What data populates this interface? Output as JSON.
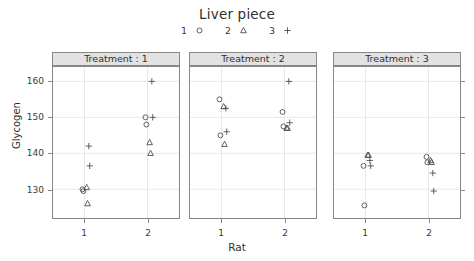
{
  "chart_data": {
    "type": "scatter",
    "title": "Liver piece",
    "xlabel": "Rat",
    "ylabel": "Glycogen",
    "grid": true,
    "legend_position": "top",
    "legend_title": "Liver piece",
    "x_categories": [
      "1",
      "2"
    ],
    "xlim": [
      0.5,
      2.5
    ],
    "ylim": [
      122,
      164
    ],
    "yticks": [
      130,
      140,
      150,
      160
    ],
    "ytick_labels": [
      "130",
      "140",
      "150",
      "160"
    ],
    "panel_variable": "Treatment",
    "panels": [
      {
        "label": "Treatment : 1",
        "series": [
          {
            "name": "1",
            "symbol": "circle",
            "points": [
              {
                "x": 1,
                "y": 130.0
              },
              {
                "x": 1,
                "y": 129.5
              },
              {
                "x": 2,
                "y": 150.0
              },
              {
                "x": 2,
                "y": 148.0
              }
            ]
          },
          {
            "name": "2",
            "symbol": "triangle",
            "points": [
              {
                "x": 1,
                "y": 130.5
              },
              {
                "x": 1,
                "y": 126.0
              },
              {
                "x": 2,
                "y": 143.0
              },
              {
                "x": 2,
                "y": 140.0
              }
            ]
          },
          {
            "name": "3",
            "symbol": "plus",
            "points": [
              {
                "x": 1,
                "y": 142.0
              },
              {
                "x": 1,
                "y": 136.5
              },
              {
                "x": 2,
                "y": 160.0
              },
              {
                "x": 2,
                "y": 150.0
              }
            ]
          }
        ]
      },
      {
        "label": "Treatment : 2",
        "series": [
          {
            "name": "1",
            "symbol": "circle",
            "points": [
              {
                "x": 1,
                "y": 155.0
              },
              {
                "x": 1,
                "y": 145.0
              },
              {
                "x": 2,
                "y": 151.5
              },
              {
                "x": 2,
                "y": 147.5
              }
            ]
          },
          {
            "name": "2",
            "symbol": "triangle",
            "points": [
              {
                "x": 1,
                "y": 153.0
              },
              {
                "x": 1,
                "y": 142.5
              },
              {
                "x": 2,
                "y": 147.0
              },
              {
                "x": 2,
                "y": 147.0
              }
            ]
          },
          {
            "name": "3",
            "symbol": "plus",
            "points": [
              {
                "x": 1,
                "y": 152.5
              },
              {
                "x": 1,
                "y": 146.0
              },
              {
                "x": 2,
                "y": 160.0
              },
              {
                "x": 2,
                "y": 148.5
              }
            ]
          }
        ]
      },
      {
        "label": "Treatment : 3",
        "series": [
          {
            "name": "1",
            "symbol": "circle",
            "points": [
              {
                "x": 1,
                "y": 136.5
              },
              {
                "x": 1,
                "y": 125.5
              },
              {
                "x": 2,
                "y": 139.0
              },
              {
                "x": 2,
                "y": 137.5
              }
            ]
          },
          {
            "name": "2",
            "symbol": "triangle",
            "points": [
              {
                "x": 1,
                "y": 139.5
              },
              {
                "x": 1,
                "y": 139.5
              },
              {
                "x": 2,
                "y": 138.0
              },
              {
                "x": 2,
                "y": 137.5
              }
            ]
          },
          {
            "name": "3",
            "symbol": "plus",
            "points": [
              {
                "x": 1,
                "y": 138.0
              },
              {
                "x": 1,
                "y": 136.5
              },
              {
                "x": 2,
                "y": 134.5
              },
              {
                "x": 2,
                "y": 129.5
              }
            ]
          }
        ]
      }
    ]
  },
  "legend": {
    "items": [
      {
        "label": "1",
        "symbol": "circle"
      },
      {
        "label": "2",
        "symbol": "triangle"
      },
      {
        "label": "3",
        "symbol": "plus"
      }
    ]
  },
  "colors": {
    "symbol": "#4d4d4d",
    "grid": "#e8e8e8",
    "frame": "#878787",
    "strip_bg": "#e2e2e2",
    "text": "#3a3a3a",
    "background": "#ffffff"
  }
}
